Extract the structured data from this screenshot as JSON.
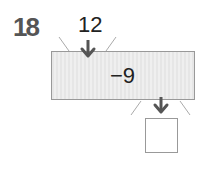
{
  "problem": {
    "number": "18",
    "input_value": "12",
    "operation": "−9",
    "answer": ""
  },
  "colors": {
    "arrow": "#555555",
    "machine_fill": "#e9e9e9",
    "border": "#999999"
  }
}
